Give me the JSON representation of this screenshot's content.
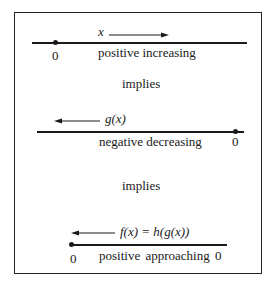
{
  "diagram": {
    "panel1": {
      "variable": "x",
      "arrow_direction": "right",
      "zero_label": "0",
      "caption": "positive increasing"
    },
    "connector1": "implies",
    "panel2": {
      "variable": "g(x)",
      "arrow_direction": "left",
      "zero_label": "0",
      "caption": "negative decreasing"
    },
    "connector2": "implies",
    "panel3": {
      "variable": "f(x) = h(g(x))",
      "arrow_direction": "left",
      "zero_label_left": "0",
      "caption": "positive approaching 0"
    }
  }
}
